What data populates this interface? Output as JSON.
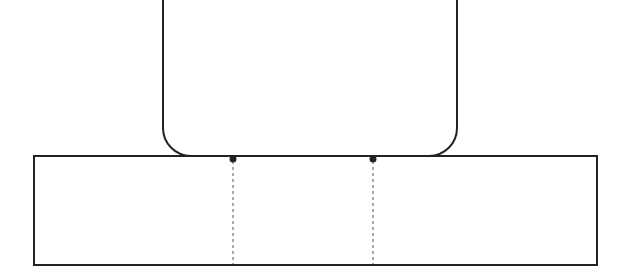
{
  "diagram": {
    "colors": {
      "stroke": "#222222",
      "background": "#ffffff",
      "dashed": "#555555"
    },
    "upper_shape": {
      "type": "rounded-rectangle",
      "x": 163,
      "y": -30,
      "width": 294,
      "height": 186,
      "corner_radius": 28
    },
    "base_shape": {
      "type": "rectangle",
      "x": 34,
      "y": 156,
      "width": 563,
      "height": 109
    },
    "contact_points": [
      {
        "x": 233,
        "y": 159
      },
      {
        "x": 373,
        "y": 159
      }
    ],
    "dashed_lines": [
      {
        "x": 233,
        "y1": 161,
        "y2": 264
      },
      {
        "x": 373,
        "y1": 161,
        "y2": 264
      }
    ]
  }
}
